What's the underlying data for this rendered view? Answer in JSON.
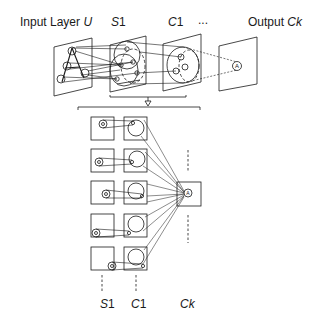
{
  "top_labels": {
    "input": {
      "text": "Input Layer ",
      "var": "U"
    },
    "s1": {
      "var": "S",
      "sub": "1"
    },
    "c1": {
      "var": "C",
      "sub": "1"
    },
    "ellipsis": "...",
    "output": {
      "text": "Output ",
      "var": "Ck"
    }
  },
  "bottom_labels": {
    "s1": {
      "var": "S",
      "sub": "1"
    },
    "c1": {
      "var": "C",
      "sub": "1"
    },
    "ck": {
      "var": "Ck"
    }
  },
  "expand_arrow": "⇩",
  "colors": {
    "ink": "#1a1a1a",
    "background": "#ffffff"
  }
}
